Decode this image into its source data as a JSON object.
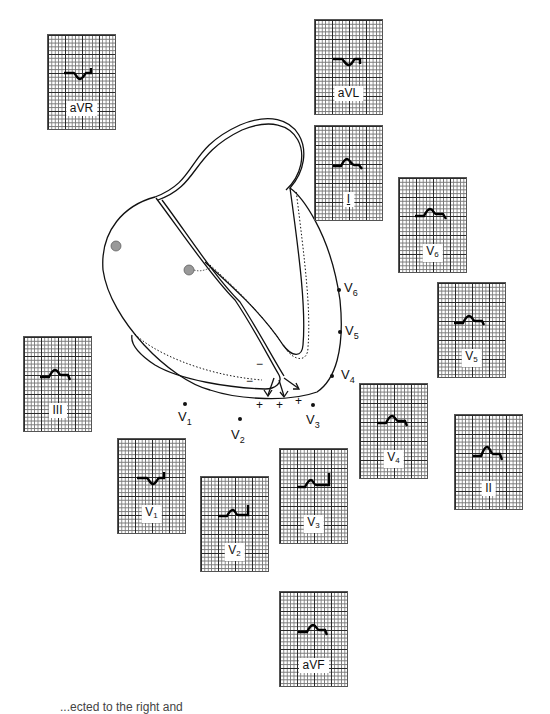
{
  "figure": {
    "caption_fragment": "...ected to the right and"
  },
  "leads": [
    {
      "id": "aVR",
      "label": "aVR",
      "sub": "",
      "pos": [
        47,
        34
      ],
      "waveform": "negative-qr"
    },
    {
      "id": "aVL",
      "label": "aVL",
      "sub": "",
      "pos": [
        314,
        19
      ],
      "waveform": "negative-qr"
    },
    {
      "id": "I",
      "label": "I",
      "sub": "",
      "pos": [
        314,
        125
      ],
      "waveform": "small-r-s"
    },
    {
      "id": "V6",
      "label": "V",
      "sub": "6",
      "pos": [
        398,
        177
      ],
      "waveform": "small-r-s"
    },
    {
      "id": "V5",
      "label": "V",
      "sub": "5",
      "pos": [
        437,
        282
      ],
      "waveform": "small-r-s"
    },
    {
      "id": "III",
      "label": "III",
      "sub": "",
      "pos": [
        23,
        336
      ],
      "waveform": "small-r-s"
    },
    {
      "id": "V4",
      "label": "V",
      "sub": "4",
      "pos": [
        359,
        383
      ],
      "waveform": "small-r-s"
    },
    {
      "id": "II",
      "label": "II",
      "sub": "",
      "pos": [
        454,
        414
      ],
      "waveform": "r-s"
    },
    {
      "id": "V1",
      "label": "V",
      "sub": "1",
      "pos": [
        117,
        438
      ],
      "waveform": "qs-st"
    },
    {
      "id": "V3",
      "label": "V",
      "sub": "3",
      "pos": [
        279,
        448
      ],
      "waveform": "r-st-up"
    },
    {
      "id": "V2",
      "label": "V",
      "sub": "2",
      "pos": [
        200,
        476
      ],
      "waveform": "r-st-up"
    },
    {
      "id": "aVF",
      "label": "aVF",
      "sub": "",
      "pos": [
        279,
        591
      ],
      "waveform": "small-r-s"
    }
  ],
  "electrodes": [
    {
      "id": "V1",
      "label": "V",
      "sub": "1",
      "dot": [
        185,
        404
      ],
      "text": [
        180,
        410
      ]
    },
    {
      "id": "V2",
      "label": "V",
      "sub": "2",
      "dot": [
        240,
        419
      ],
      "text": [
        233,
        428
      ]
    },
    {
      "id": "V3",
      "label": "V",
      "sub": "3",
      "dot": [
        313,
        405
      ],
      "text": [
        308,
        415
      ]
    },
    {
      "id": "V4",
      "label": "V",
      "sub": "4",
      "dot": [
        332,
        375
      ],
      "text": [
        343,
        370
      ]
    },
    {
      "id": "V5",
      "label": "V",
      "sub": "5",
      "dot": [
        340,
        332
      ],
      "text": [
        347,
        327
      ]
    },
    {
      "id": "V6",
      "label": "V",
      "sub": "6",
      "dot": [
        339,
        290
      ],
      "text": [
        346,
        283
      ]
    }
  ],
  "annotations": {
    "minus_signs": [
      "−",
      "−"
    ],
    "plus_signs": [
      "+",
      "+",
      "+"
    ]
  }
}
